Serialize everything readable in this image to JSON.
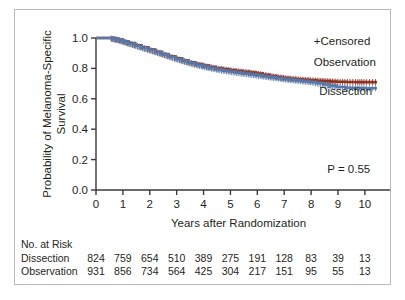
{
  "figure": {
    "border_color": "#b9b9b9",
    "background": "#ffffff"
  },
  "chart_data": {
    "type": "line",
    "title": "",
    "xlabel": "Years after Randomization",
    "ylabel": "Probability of Melanoma-Specific Survival",
    "xlim": [
      0,
      10.6
    ],
    "ylim": [
      0.0,
      1.0
    ],
    "xticks": [
      0,
      1,
      2,
      3,
      4,
      5,
      6,
      7,
      8,
      9,
      10
    ],
    "xtick_labels": [
      "0",
      "1",
      "2",
      "3",
      "4",
      "5",
      "6",
      "7",
      "8",
      "9",
      "10"
    ],
    "yticks": [
      0.0,
      0.2,
      0.4,
      0.6,
      0.8,
      1.0
    ],
    "ytick_labels": [
      "0.0",
      "0.2",
      "0.4",
      "0.6",
      "0.8",
      "1.0"
    ],
    "grid": false,
    "legend_position": "upper-right-inline",
    "annotations": [
      {
        "name": "censored-key",
        "text": "+Censored",
        "x": 8.1,
        "y": 0.955
      },
      {
        "name": "observation-label",
        "text": "Observation",
        "x": 8.1,
        "y": 0.815
      },
      {
        "name": "dissection-label",
        "text": "Dissection",
        "x": 8.3,
        "y": 0.625
      },
      {
        "name": "p-value",
        "text": "P = 0.55",
        "x": 8.6,
        "y": 0.115
      }
    ],
    "series": [
      {
        "name": "Observation",
        "color": "#8f3322",
        "x": [
          0,
          0.35,
          0.6,
          0.8,
          1.0,
          1.2,
          1.45,
          1.7,
          1.95,
          2.2,
          2.45,
          2.7,
          2.95,
          3.2,
          3.45,
          3.7,
          3.95,
          4.2,
          4.45,
          4.7,
          4.95,
          5.2,
          5.45,
          5.7,
          5.95,
          6.2,
          6.45,
          6.7,
          6.95,
          7.2,
          7.45,
          7.7,
          7.95,
          8.2,
          8.45,
          8.7,
          8.95,
          9.3,
          9.7,
          10.0,
          10.45
        ],
        "y": [
          1.0,
          1.0,
          0.995,
          0.988,
          0.978,
          0.966,
          0.952,
          0.938,
          0.924,
          0.91,
          0.895,
          0.88,
          0.866,
          0.852,
          0.839,
          0.828,
          0.818,
          0.809,
          0.801,
          0.794,
          0.788,
          0.782,
          0.777,
          0.772,
          0.766,
          0.758,
          0.75,
          0.743,
          0.737,
          0.732,
          0.728,
          0.725,
          0.722,
          0.719,
          0.716,
          0.714,
          0.712,
          0.711,
          0.71,
          0.71,
          0.71
        ]
      },
      {
        "name": "Dissection",
        "color": "#5878a8",
        "x": [
          0,
          0.35,
          0.6,
          0.8,
          1.0,
          1.2,
          1.45,
          1.7,
          1.95,
          2.2,
          2.45,
          2.7,
          2.95,
          3.2,
          3.45,
          3.7,
          3.95,
          4.2,
          4.45,
          4.7,
          4.95,
          5.2,
          5.45,
          5.7,
          5.95,
          6.2,
          6.45,
          6.7,
          6.95,
          7.2,
          7.45,
          7.7,
          7.95,
          8.2,
          8.45,
          8.7,
          8.95,
          9.3,
          9.7,
          10.0,
          10.45
        ],
        "y": [
          1.0,
          1.0,
          0.994,
          0.986,
          0.976,
          0.963,
          0.949,
          0.935,
          0.921,
          0.907,
          0.892,
          0.877,
          0.862,
          0.848,
          0.835,
          0.823,
          0.812,
          0.802,
          0.793,
          0.785,
          0.778,
          0.771,
          0.765,
          0.759,
          0.753,
          0.747,
          0.741,
          0.735,
          0.729,
          0.724,
          0.719,
          0.714,
          0.709,
          0.702,
          0.694,
          0.685,
          0.678,
          0.673,
          0.67,
          0.669,
          0.669
        ]
      }
    ]
  },
  "risk_table": {
    "header": "No. at Risk",
    "xticks": [
      0,
      1,
      2,
      3,
      4,
      5,
      6,
      7,
      8,
      9,
      10
    ],
    "rows": [
      {
        "label": "Dissection",
        "values": [
          "824",
          "759",
          "654",
          "510",
          "389",
          "275",
          "191",
          "128",
          "83",
          "39",
          "13"
        ]
      },
      {
        "label": "Observation",
        "values": [
          "931",
          "856",
          "734",
          "564",
          "425",
          "304",
          "217",
          "151",
          "95",
          "55",
          "13"
        ]
      }
    ]
  }
}
